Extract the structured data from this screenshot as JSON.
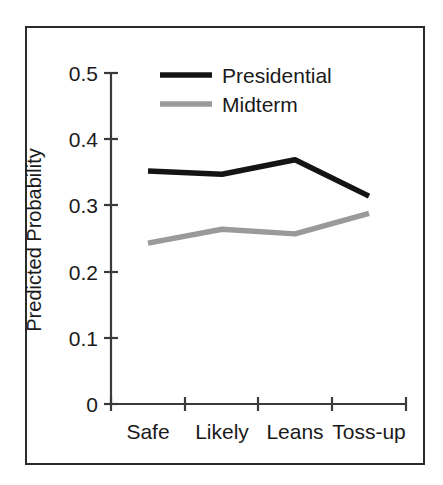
{
  "chart_data": {
    "type": "line",
    "title": "",
    "xlabel": "",
    "ylabel": "Predicted Probability",
    "categories": [
      "Safe",
      "Likely",
      "Leans",
      "Toss-up"
    ],
    "ylim": [
      0,
      0.5
    ],
    "yticks": [
      0,
      0.1,
      0.2,
      0.3,
      0.4,
      0.5
    ],
    "ytick_labels": [
      "0",
      "0.1",
      "0.2",
      "0.3",
      "0.4",
      "0.5"
    ],
    "grid": false,
    "legend_position": "top-center",
    "series": [
      {
        "name": "Presidential",
        "color": "#141414",
        "values": [
          0.352,
          0.347,
          0.369,
          0.314
        ]
      },
      {
        "name": "Midterm",
        "color": "#9a9a9a",
        "values": [
          0.243,
          0.264,
          0.257,
          0.288
        ]
      }
    ]
  },
  "axis": {
    "y_label": "Predicted Probability",
    "y_ticks": [
      "0.5",
      "0.4",
      "0.3",
      "0.2",
      "0.1",
      "0"
    ],
    "x_ticks": [
      "Safe",
      "Likely",
      "Leans",
      "Toss-up"
    ]
  },
  "legend": {
    "items": [
      {
        "label": "Presidential",
        "color": "#141414"
      },
      {
        "label": "Midterm",
        "color": "#9a9a9a"
      }
    ]
  },
  "colors": {
    "presidential": "#141414",
    "midterm": "#9a9a9a",
    "axis": "#3a3a3a",
    "frame": "#2b2b2b",
    "background": "#ffffff"
  }
}
